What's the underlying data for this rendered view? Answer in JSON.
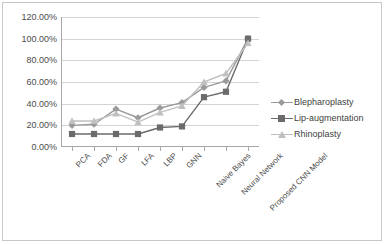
{
  "chart_data": {
    "type": "line",
    "title": "",
    "xlabel": "",
    "ylabel": "",
    "ylim": [
      0,
      120
    ],
    "ytick_labels": [
      "0.00%",
      "20.00%",
      "40.00%",
      "60.00%",
      "80.00%",
      "100.00%",
      "120.00%"
    ],
    "ytick_values": [
      0,
      20,
      40,
      60,
      80,
      100,
      120
    ],
    "grid": "horizontal",
    "legend_position": "right",
    "categories": [
      "PCA",
      "FDA",
      "GF",
      "LFA",
      "LBP",
      "GNN",
      "Naive Bayes",
      "Neural Network",
      "Proposed CNN Model"
    ],
    "series": [
      {
        "name": "Blepharoplasty",
        "marker": "diamond",
        "color": "#9a9a9a",
        "values": [
          20,
          21,
          35,
          27,
          36,
          41,
          55,
          61,
          100
        ]
      },
      {
        "name": "Lip-augmentation",
        "marker": "square",
        "color": "#6b6b6b",
        "values": [
          12,
          12,
          12,
          12,
          18,
          19,
          46,
          51,
          100
        ]
      },
      {
        "name": "Rhinoplasty",
        "marker": "triangle",
        "color": "#c0c0c0",
        "values": [
          24,
          24,
          31,
          23,
          32,
          38,
          60,
          68,
          96
        ]
      }
    ]
  },
  "legend": {
    "items": [
      {
        "label": "Blepharoplasty"
      },
      {
        "label": "Lip-augmentation"
      },
      {
        "label": "Rhinoplasty"
      }
    ]
  },
  "colors": {
    "frame_border": "#c8c8c8",
    "grid": "#d4d4d4",
    "axis": "#a8a8a8",
    "text": "#4d4d4d",
    "series_1": "#9a9a9a",
    "series_2": "#6b6b6b",
    "series_3": "#c0c0c0"
  }
}
